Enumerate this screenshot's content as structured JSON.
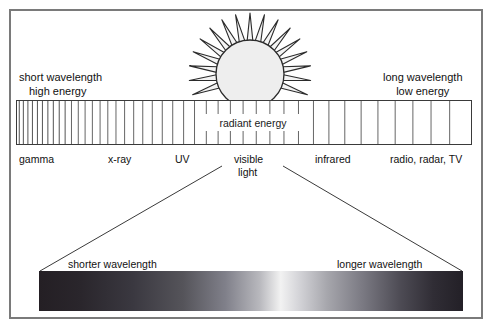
{
  "figure": {
    "background_color": "#ffffff",
    "border_color": "#7a7a7a"
  },
  "sun": {
    "name": "sun-illustration",
    "ray_count": 17,
    "disc_fill": "#eeeeee",
    "stroke_color": "#2b2b2b"
  },
  "spectrum": {
    "center_label": "radiant energy",
    "left_note_line1": "short wavelength",
    "left_note_line2": "high energy",
    "right_note_line1": "long wavelength",
    "right_note_line2": "low energy",
    "bands": [
      {
        "label": "gamma",
        "x": 19
      },
      {
        "label": "x-ray",
        "x": 108
      },
      {
        "label": "UV",
        "x": 175
      },
      {
        "label": "visible",
        "x": 234
      },
      {
        "label": "light",
        "x": 238
      },
      {
        "label": "infrared",
        "x": 315
      },
      {
        "label": "radio, radar, TV",
        "x": 390
      }
    ]
  },
  "visible_light_bar": {
    "left_label": "shorter wavelength",
    "right_label": "longer wavelength"
  },
  "chart_data": {
    "type": "bar",
    "xlabel": "wavelength (increasing to the right)",
    "ylabel": "",
    "categories": [
      "gamma",
      "x-ray",
      "UV",
      "visible light",
      "infrared",
      "radio, radar, TV"
    ],
    "values": [
      1,
      1,
      1,
      1,
      1,
      1
    ],
    "annotations": [
      "short wavelength high energy",
      "long wavelength low energy",
      "radiant energy",
      "shorter wavelength",
      "longer wavelength"
    ],
    "tick_positions": [
      0.5,
      1.4,
      2.4,
      3.4,
      4.5,
      5.6,
      6.8,
      8.0,
      9.3,
      10.6,
      12.0,
      13.5,
      15.0,
      16.6,
      18.3,
      20.0,
      21.8,
      23.7,
      25.7,
      27.7,
      29.8,
      32.0,
      34.3,
      36.7,
      39.1,
      41.7,
      44.3,
      47.0,
      49.8,
      52.7,
      55.7,
      58.8,
      62.0,
      65.3,
      68.7,
      72.2,
      75.8,
      79.5,
      83.3,
      87.2,
      91.2,
      95.3
    ],
    "gradient_stops": [
      {
        "pos": 0,
        "gray": "#241f24"
      },
      {
        "pos": 10,
        "gray": "#2a262c"
      },
      {
        "pos": 22,
        "gray": "#3a3840"
      },
      {
        "pos": 34,
        "gray": "#55545a"
      },
      {
        "pos": 44,
        "gray": "#80808a"
      },
      {
        "pos": 52,
        "gray": "#b8b8bd"
      },
      {
        "pos": 57,
        "gray": "#f2f2f2"
      },
      {
        "pos": 61,
        "gray": "#d6d6da"
      },
      {
        "pos": 68,
        "gray": "#a6a6ac"
      },
      {
        "pos": 76,
        "gray": "#7c7b84"
      },
      {
        "pos": 85,
        "gray": "#4e4c55"
      },
      {
        "pos": 93,
        "gray": "#302d35"
      },
      {
        "pos": 100,
        "gray": "#232027"
      }
    ],
    "grid": false,
    "legend": "none"
  }
}
